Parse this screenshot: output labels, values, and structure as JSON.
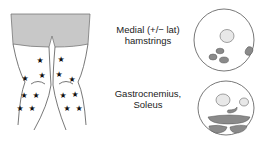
{
  "diagram": {
    "legs_illustration": {
      "description": "posterior view of thighs and calves with star markers",
      "marker_icon": "star-icon",
      "shorts_color": "#c8c8c8",
      "marker_color": "#111111"
    },
    "rows": [
      {
        "label_line1": "Medial (+/− lat)",
        "label_line2": "hamstrings",
        "cross_section": "thigh-cross-section"
      },
      {
        "label_line1": "Gastrocnemius,",
        "label_line2": "Soleus",
        "cross_section": "calf-cross-section"
      }
    ],
    "colors": {
      "affected_muscle": "#8a8a8a",
      "bone": "#e8e8e8",
      "outline": "#555555"
    }
  }
}
